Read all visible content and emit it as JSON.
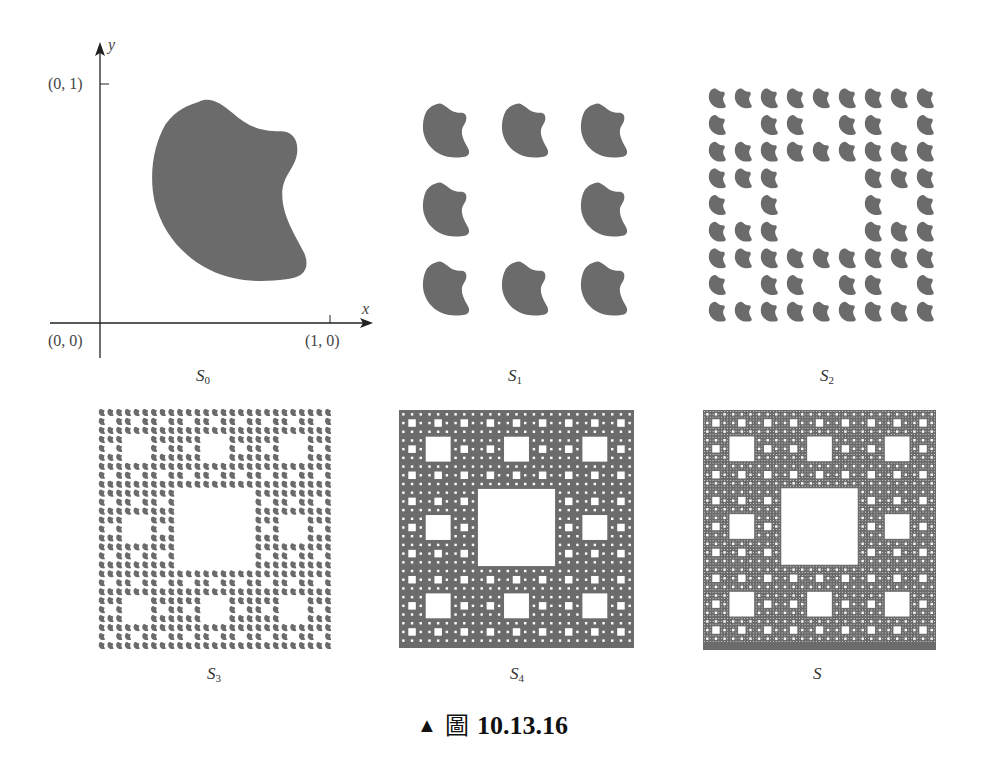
{
  "colors": {
    "fill": "#6b6b6b",
    "axis": "#222222",
    "text": "#333333"
  },
  "figure": {
    "caption": {
      "marker": "▲",
      "prefix": "圖",
      "number": "10.13.16"
    },
    "axes": {
      "x_label": "x",
      "y_label": "y",
      "origin_label": "(0, 0)",
      "x_tick_label": "(1, 0)",
      "y_tick_label": "(0, 1)"
    },
    "panels": [
      {
        "id": "S0",
        "symbol": "S",
        "subscript": "0",
        "description": "initial shape"
      },
      {
        "id": "S1",
        "symbol": "S",
        "subscript": "1",
        "description": "8 scaled copies in 3x3 grid, center removed"
      },
      {
        "id": "S2",
        "symbol": "S",
        "subscript": "2",
        "description": "64 copies, Sierpinski carpet level 2"
      },
      {
        "id": "S3",
        "symbol": "S",
        "subscript": "3",
        "description": "512 copies, level 3"
      },
      {
        "id": "S4",
        "symbol": "S",
        "subscript": "4",
        "description": "level 4"
      },
      {
        "id": "S",
        "symbol": "S",
        "subscript": "",
        "description": "limit set (Sierpinski carpet)"
      }
    ]
  }
}
